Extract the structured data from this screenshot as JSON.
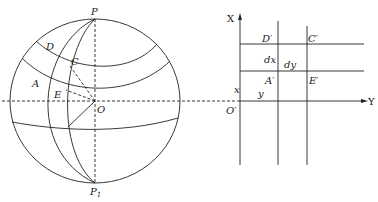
{
  "sphere": {
    "labels": {
      "P": "P",
      "P1_main": "P",
      "P1_sub": "1",
      "D": "D",
      "C": "C",
      "A": "A",
      "E": "E",
      "O": "O"
    }
  },
  "plane": {
    "labels": {
      "X": "X",
      "Y": "Y",
      "D_prime": "D′",
      "C_prime": "C′",
      "A_prime": "A′",
      "E_prime": "E′",
      "O_prime": "O′",
      "dx": "dx",
      "dy": "dy",
      "x": "x",
      "y": "y"
    }
  },
  "colors": {
    "stroke": "#222222",
    "background": "#ffffff"
  }
}
